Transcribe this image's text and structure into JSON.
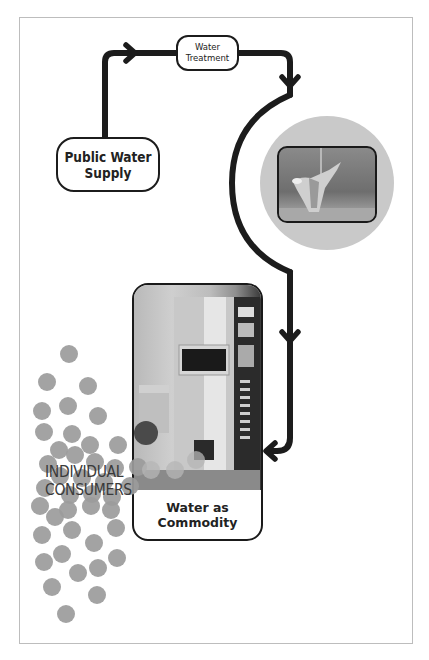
{
  "diagram": {
    "nodes": {
      "public_water_supply": "Public Water\nSupply",
      "water_treatment": "Water\nTreatment",
      "water_as_commodity": "Water as\nCommodity",
      "individual_consumers": "INDIVIDUAL\nCONSUMERS"
    },
    "images": {
      "faucet_photo": "faucet-photo",
      "vending_machine_photo": "water-vending-machine-photo"
    },
    "colors": {
      "pipe": "#1c1c1c",
      "dots": "#9b9b9b",
      "circle_bg": "#c9c9c9",
      "frame_border": "#bdbdbd"
    }
  }
}
